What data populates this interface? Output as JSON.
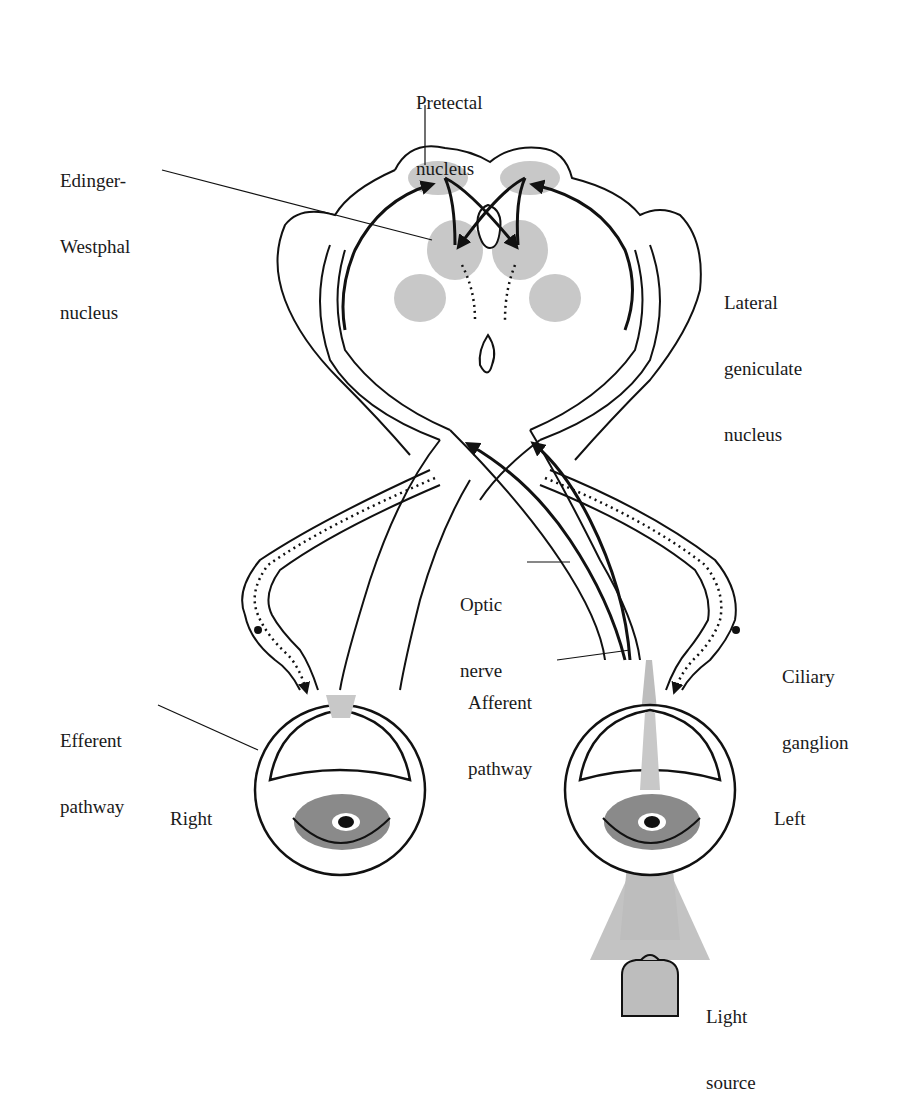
{
  "diagram": {
    "type": "pupillary light reflex pathway",
    "colors": {
      "line": "#111111",
      "nucleus_fill": "#c8c8c8",
      "light_fill": "#bdbdbd",
      "iris_fill": "#8a8a8a",
      "background": "#ffffff"
    },
    "labels": {
      "pretectal": [
        "Pretectal",
        "nucleus"
      ],
      "edinger": [
        "Edinger-",
        "Westphal",
        "nucleus"
      ],
      "lgn": [
        "Lateral",
        "geniculate",
        "nucleus"
      ],
      "optic": [
        "Optic",
        "nerve"
      ],
      "ciliary": [
        "Ciliary",
        "ganglion"
      ],
      "afferent": [
        "Afferent",
        "pathway"
      ],
      "efferent": [
        "Efferent",
        "pathway"
      ],
      "right": [
        "Right"
      ],
      "left": [
        "Left"
      ],
      "light": [
        "Light",
        "source"
      ]
    }
  }
}
